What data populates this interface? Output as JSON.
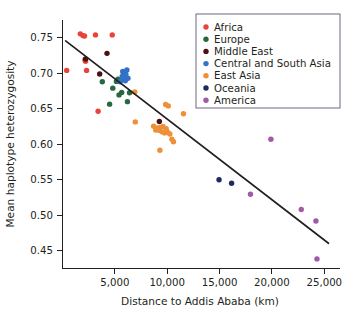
{
  "chart_data": {
    "type": "scatter",
    "title": "",
    "xlabel": "Distance to Addis Ababa (km)",
    "ylabel": "Mean haplotype heterozygosity",
    "xlim": [
      0,
      26500
    ],
    "ylim": [
      0.425,
      0.775
    ],
    "xticks": [
      5000,
      10000,
      15000,
      20000,
      25000
    ],
    "xticklabels": [
      "5,000",
      "10,000",
      "15,000",
      "20,000",
      "25,000"
    ],
    "yticks": [
      0.45,
      0.5,
      0.55,
      0.6,
      0.65,
      0.7,
      0.75
    ],
    "yticklabels": [
      "0.45",
      "0.50",
      "0.55",
      "0.60",
      "0.65",
      "0.70",
      "0.75"
    ],
    "grid": false,
    "legend_position": "top-right",
    "trendline": {
      "label": "linear-regression-fit",
      "x": [
        300,
        25400
      ],
      "y": [
        0.7455,
        0.4605
      ],
      "color": "#231f20"
    },
    "series": [
      {
        "name": "Africa",
        "color": "#e8443a",
        "points": [
          [
            1700,
            0.7555
          ],
          [
            1950,
            0.753
          ],
          [
            2100,
            0.7525
          ],
          [
            3150,
            0.754
          ],
          [
            4750,
            0.754
          ],
          [
            2150,
            0.719
          ],
          [
            2200,
            0.717
          ],
          [
            400,
            0.704
          ],
          [
            2300,
            0.704
          ],
          [
            3400,
            0.6465
          ]
        ]
      },
      {
        "name": "Europe",
        "color": "#27683f",
        "points": [
          [
            3800,
            0.688
          ],
          [
            5150,
            0.6885
          ],
          [
            5300,
            0.6915
          ],
          [
            4800,
            0.679
          ],
          [
            5650,
            0.673
          ],
          [
            6400,
            0.6725
          ],
          [
            5400,
            0.6695
          ],
          [
            6200,
            0.66
          ],
          [
            4500,
            0.6565
          ]
        ]
      },
      {
        "name": "Middle East",
        "color": "#4a1112",
        "points": [
          [
            4250,
            0.728
          ],
          [
            2200,
            0.72
          ],
          [
            3550,
            0.699
          ],
          [
            9250,
            0.632
          ]
        ]
      },
      {
        "name": "Central and South Asia",
        "color": "#3273c6",
        "points": [
          [
            5750,
            0.7025
          ],
          [
            5950,
            0.702
          ],
          [
            6150,
            0.7045
          ],
          [
            5800,
            0.6975
          ],
          [
            6050,
            0.6985
          ],
          [
            5700,
            0.6955
          ],
          [
            5900,
            0.693
          ],
          [
            6250,
            0.693
          ],
          [
            5600,
            0.69
          ],
          [
            6000,
            0.6895
          ],
          [
            5500,
            0.688
          ]
        ]
      },
      {
        "name": "East Asia",
        "color": "#ee9038",
        "points": [
          [
            6900,
            0.6735
          ],
          [
            9850,
            0.656
          ],
          [
            10100,
            0.654
          ],
          [
            11550,
            0.643
          ],
          [
            6950,
            0.6315
          ],
          [
            8700,
            0.6255
          ],
          [
            9050,
            0.623
          ],
          [
            9350,
            0.6235
          ],
          [
            9600,
            0.625
          ],
          [
            9900,
            0.622
          ],
          [
            8900,
            0.62
          ],
          [
            9250,
            0.6195
          ],
          [
            9500,
            0.6175
          ],
          [
            9750,
            0.616
          ],
          [
            10050,
            0.617
          ],
          [
            10250,
            0.6145
          ],
          [
            10450,
            0.607
          ],
          [
            10600,
            0.6035
          ],
          [
            9300,
            0.5915
          ]
        ]
      },
      {
        "name": "Oceania",
        "color": "#1c2a5e",
        "points": [
          [
            14950,
            0.55
          ],
          [
            16150,
            0.545
          ]
        ]
      },
      {
        "name": "America",
        "color": "#9f5ba3",
        "points": [
          [
            19900,
            0.607
          ],
          [
            17950,
            0.5295
          ],
          [
            22800,
            0.508
          ],
          [
            24200,
            0.492
          ],
          [
            24300,
            0.4385
          ]
        ]
      }
    ],
    "legend": [
      {
        "label": "Africa",
        "color": "#e8443a"
      },
      {
        "label": "Europe",
        "color": "#27683f"
      },
      {
        "label": "Middle East",
        "color": "#4a1112"
      },
      {
        "label": "Central and South Asia",
        "color": "#3273c6"
      },
      {
        "label": "East Asia",
        "color": "#ee9038"
      },
      {
        "label": "Oceania",
        "color": "#1c2a5e"
      },
      {
        "label": "America",
        "color": "#9f5ba3"
      }
    ]
  }
}
